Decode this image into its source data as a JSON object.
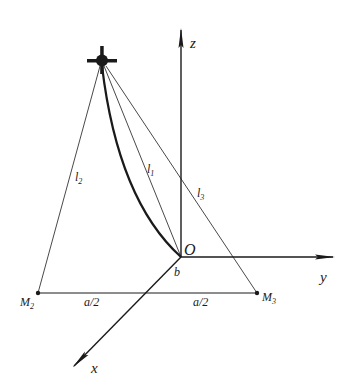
{
  "diagram": {
    "type": "3d-coordinate-geometry",
    "axes": {
      "x": {
        "label": "x"
      },
      "y": {
        "label": "y"
      },
      "z": {
        "label": "z"
      }
    },
    "origin": {
      "label": "O"
    },
    "points": {
      "m2": {
        "label": "M",
        "subscript": "2"
      },
      "m3": {
        "label": "M",
        "subscript": "3"
      },
      "node": {
        "semantic": "drone-node-icon"
      }
    },
    "segments": {
      "l1": {
        "label": "l",
        "subscript": "1"
      },
      "l2": {
        "label": "l",
        "subscript": "2"
      },
      "l3": {
        "label": "l",
        "subscript": "3"
      }
    },
    "dimensions": {
      "left_half": "a/2",
      "right_half": "a/2",
      "offset": "b"
    },
    "colors": {
      "stroke": "#1a1a1a",
      "background": "#ffffff"
    }
  }
}
